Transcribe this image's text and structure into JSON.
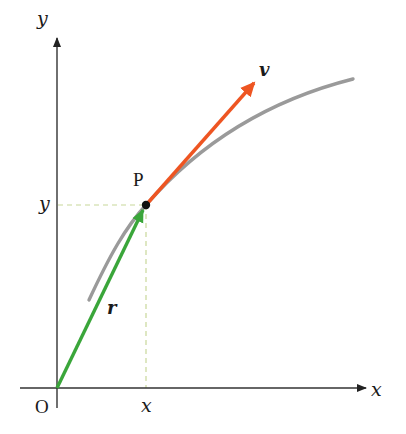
{
  "diagram": {
    "axes": {
      "x_label": "x",
      "y_label": "y",
      "origin_label": "O",
      "color": "#333333"
    },
    "point": {
      "label": "P",
      "x_tick_label": "x",
      "y_tick_label": "y",
      "dot_color": "#111111"
    },
    "vectors": [
      {
        "name": "position",
        "label": "r",
        "color": "#3aa63a"
      },
      {
        "name": "velocity",
        "label": "v",
        "color": "#ee5522"
      }
    ],
    "curve": {
      "color": "#9a9a9a"
    },
    "guides": {
      "style": "dashed",
      "color": "#c8d89a"
    }
  }
}
